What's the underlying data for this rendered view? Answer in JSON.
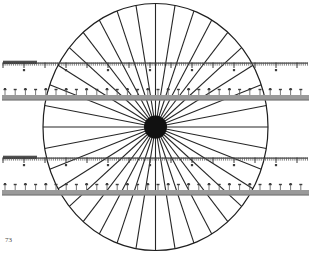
{
  "page": {
    "width": 311,
    "height": 254,
    "background": "#ffffff",
    "page_number": "73",
    "figure_kind": "radiating-spokes-with-straight-rulers-illusion"
  },
  "colors": {
    "ink": "#1a1a1a",
    "spoke": "#262626",
    "ellipse_outline": "#1f1f1f",
    "hub": "#111111",
    "ruler_gray_bar": "#9a9a9a",
    "ruler_gray_bar_edge": "#6f6f6f",
    "ruler_fine_tick": "#555555",
    "ruler_fine_line": "#3d3d3d",
    "ruler_dark_block": "#4f4f4f",
    "page_number_color": "#4a4a4a"
  },
  "figure": {
    "ellipse": {
      "label": "outer-ellipse",
      "cx": 155.5,
      "cy": 127.0,
      "rx": 112.5,
      "ry": 123.5,
      "stroke_width": 1.2
    },
    "hub": {
      "label": "central-hub",
      "cx": 155.5,
      "cy": 127.0,
      "r": 11.5
    },
    "spokes": {
      "label": "radiating-spokes",
      "count": 36,
      "start_angle_deg": 0,
      "stroke_width": 1.1,
      "inner_radius": 0
    }
  },
  "rulers": [
    {
      "name": "ruler-fine-top",
      "type": "fine",
      "y": 62.5,
      "x_start": 3,
      "x_end": 308,
      "baseline_thickness": 1.2,
      "tick_direction": "down",
      "minor_tick_step": 2.1,
      "minor_tick_length": 3.2,
      "major_tick_step": 21,
      "major_tick_length": 5.5,
      "dot_step": 42,
      "dot_offset_y": 6.5,
      "dark_block": {
        "x": 3,
        "width": 34,
        "height": 3.4,
        "offset_y": -1.8
      }
    },
    {
      "name": "ruler-gray-upper",
      "type": "gray-bar",
      "y": 95.0,
      "x_start": 2,
      "x_end": 309,
      "bar_height": 5.4,
      "tick_direction": "up",
      "tick_step": 10.2,
      "tick_length": 5.0,
      "cap_width": 3.0,
      "dot_step": 20.4,
      "dot_offset_y": -7.0
    },
    {
      "name": "ruler-fine-bottom",
      "type": "fine",
      "y": 157.5,
      "x_start": 3,
      "x_end": 308,
      "baseline_thickness": 1.2,
      "tick_direction": "down",
      "minor_tick_step": 2.1,
      "minor_tick_length": 3.2,
      "major_tick_step": 21,
      "major_tick_length": 5.5,
      "dot_step": 42,
      "dot_offset_y": 6.5,
      "dark_block": {
        "x": 3,
        "width": 34,
        "height": 3.4,
        "offset_y": -1.8
      }
    },
    {
      "name": "ruler-gray-lower",
      "type": "gray-bar",
      "y": 190.0,
      "x_start": 2,
      "x_end": 309,
      "bar_height": 5.4,
      "tick_direction": "up",
      "tick_step": 10.2,
      "tick_length": 5.0,
      "cap_width": 3.0,
      "dot_step": 20.4,
      "dot_offset_y": -7.0
    }
  ]
}
